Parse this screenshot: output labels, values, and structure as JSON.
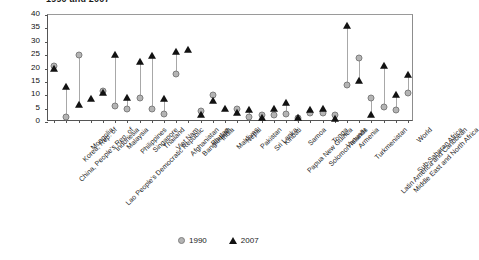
{
  "chart_data": {
    "type": "scatter",
    "title": "1990 and 2007",
    "xlabel": "",
    "ylabel": "",
    "ylim": [
      0,
      40
    ],
    "yticks": [
      0,
      5,
      10,
      15,
      20,
      25,
      30,
      35,
      40
    ],
    "grid": false,
    "legend_position": "bottom",
    "categories": [
      "China, People's Rep. of",
      "Korea, Rep. of",
      "Mongolia",
      "Lao People's Democratic Republic",
      "Indonesia",
      "Malaysia",
      "Philippines",
      "Singapore",
      "Thailand",
      "Viet Nam",
      "Afghanistan",
      "Bangladesh",
      "Bhutan",
      "India",
      "Maldives",
      "Nepal",
      "Pakistan",
      "Sri Lanka",
      "Kiribati",
      "Papua New Guinea",
      "Samoa",
      "Solomon Islands",
      "Tonga",
      "Vanuatu",
      "Armenia",
      "Turkmenistan",
      "Latin America and Caribbean",
      "Middle East and North Africa",
      "Sub-Saharan Africa",
      "World"
    ],
    "series": [
      {
        "name": "1990",
        "marker": "circle",
        "color": "#b4b4b4",
        "values": [
          21,
          2,
          25,
          null,
          11.5,
          6,
          5,
          9,
          5,
          3,
          18,
          null,
          4,
          10,
          null,
          5,
          2,
          2.5,
          2.5,
          3,
          1.5,
          3.5,
          3.5,
          2.5,
          14,
          24,
          9,
          5.5,
          4.5,
          11
        ]
      },
      {
        "name": "2007",
        "marker": "triangle",
        "color": "#121212",
        "values": [
          20,
          13,
          6.5,
          8.5,
          11,
          25,
          9,
          22.5,
          24.5,
          8.5,
          26,
          27,
          2.5,
          8,
          5,
          3.5,
          4.5,
          1.5,
          5,
          7,
          1.5,
          4.5,
          5,
          1,
          36,
          15.5,
          2.5,
          21,
          10,
          17.5
        ]
      }
    ]
  },
  "legend": {
    "entries": [
      {
        "label": "1990",
        "marker": "circle"
      },
      {
        "label": "2007",
        "marker": "triangle"
      }
    ]
  }
}
